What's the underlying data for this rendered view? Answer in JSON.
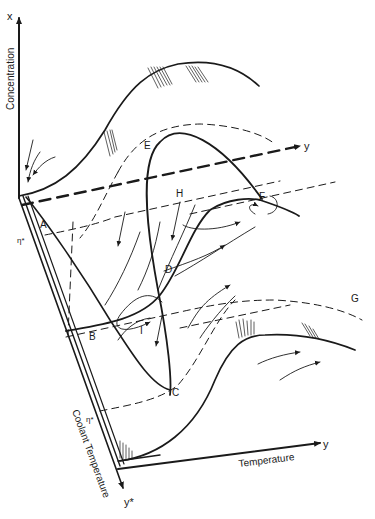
{
  "diagram": {
    "type": "phase-space surface diagram (3-D sketch)",
    "axes": {
      "vertical": {
        "symbol": "x",
        "label": "Concentration"
      },
      "horizontal": {
        "symbol": "y",
        "label": "Temperature"
      },
      "oblique": {
        "symbol": "y*",
        "label": "Coolant Temperature"
      },
      "back_y_axis": {
        "symbol": "y"
      }
    },
    "markers": {
      "eta_star_upper": "η*",
      "eta_star_lower": "η*"
    },
    "points": {
      "A": "A",
      "B": "B",
      "C": "C",
      "D": "D",
      "E": "E",
      "F": "F",
      "G": "G",
      "H": "H",
      "I": "I"
    },
    "colors": {
      "ink": "#1a1a1a",
      "background": "#ffffff"
    }
  }
}
